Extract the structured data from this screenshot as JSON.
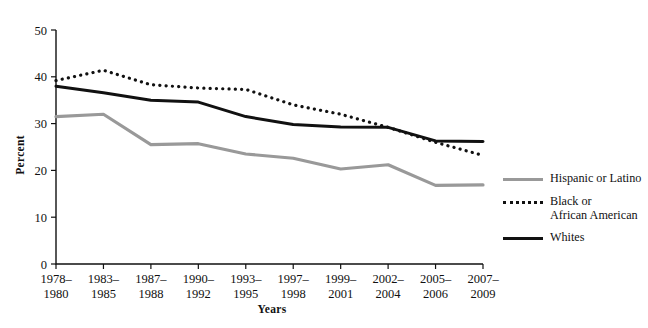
{
  "chart_data": {
    "type": "line",
    "title": "",
    "xlabel": "Years",
    "ylabel": "Percent",
    "ylim": [
      0,
      50
    ],
    "yticks": [
      0,
      10,
      20,
      30,
      40,
      50
    ],
    "grid": false,
    "legend_position": "right",
    "categories": [
      "1978–\n1980",
      "1983–\n1985",
      "1987–\n1988",
      "1990–\n1992",
      "1993–\n1995",
      "1997–\n1998",
      "1999–\n2001",
      "2002–\n2004",
      "2005–\n2006",
      "2007–\n2009"
    ],
    "series": [
      {
        "name": "Hispanic or Latino",
        "color": "#999999",
        "style": "solid",
        "values": [
          31.5,
          32.0,
          25.5,
          25.7,
          23.5,
          22.6,
          20.3,
          21.2,
          16.8,
          16.9
        ]
      },
      {
        "name": "Black or\nAfrican American",
        "color": "#111111",
        "style": "dotted",
        "values": [
          39.2,
          41.4,
          38.3,
          37.6,
          37.3,
          34.0,
          32.0,
          29.2,
          26.0,
          23.2
        ]
      },
      {
        "name": "Whites",
        "color": "#111111",
        "style": "solid",
        "values": [
          38.0,
          36.6,
          35.0,
          34.6,
          31.5,
          29.8,
          29.3,
          29.2,
          26.3,
          26.2
        ]
      }
    ]
  },
  "legend": {
    "items": [
      {
        "label": "Hispanic or Latino"
      },
      {
        "label": "Black or\nAfrican American"
      },
      {
        "label": "Whites"
      }
    ]
  },
  "axes": {
    "y_title": "Percent",
    "x_title": "Years"
  }
}
